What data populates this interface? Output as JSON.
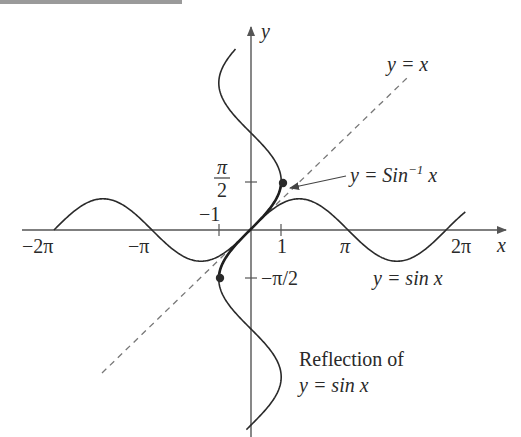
{
  "figure": {
    "axes": {
      "x_label": "x",
      "y_label": "y",
      "x_ticks": [
        {
          "label": "−2π",
          "value": -6.2832
        },
        {
          "label": "−π",
          "value": -3.1416
        },
        {
          "label": "1",
          "value": 1
        },
        {
          "label": "π",
          "value": 3.1416
        },
        {
          "label": "2π",
          "value": 6.2832
        }
      ],
      "x_tick_minus_one": "−1",
      "y_ticks": [
        {
          "label_num": "π",
          "label_den": "2",
          "value": 1.5708
        },
        {
          "label": "−π/2",
          "value": -1.5708
        }
      ]
    },
    "curves": [
      {
        "name": "sine",
        "label": "y = sin x",
        "style": "solid",
        "domain": [
          -6.2832,
          6.9
        ]
      },
      {
        "name": "reflection",
        "label_line1": "Reflection of",
        "label_line2": "y = sin x",
        "style": "solid"
      },
      {
        "name": "arcsin",
        "label_prefix": "y = Sin",
        "label_sup": "−1",
        "label_suffix": " x",
        "style": "bold",
        "domain": [
          -1,
          1
        ]
      },
      {
        "name": "identity",
        "label": "y = x",
        "style": "dashed"
      }
    ],
    "points": [
      {
        "x": 1,
        "y": 1.5708
      },
      {
        "x": -1,
        "y": -1.5708
      }
    ],
    "colors": {
      "ink": "#2a2a2a",
      "axis": "#555555",
      "dashed": "#777777",
      "top_bar": "#9a9a9a"
    }
  }
}
